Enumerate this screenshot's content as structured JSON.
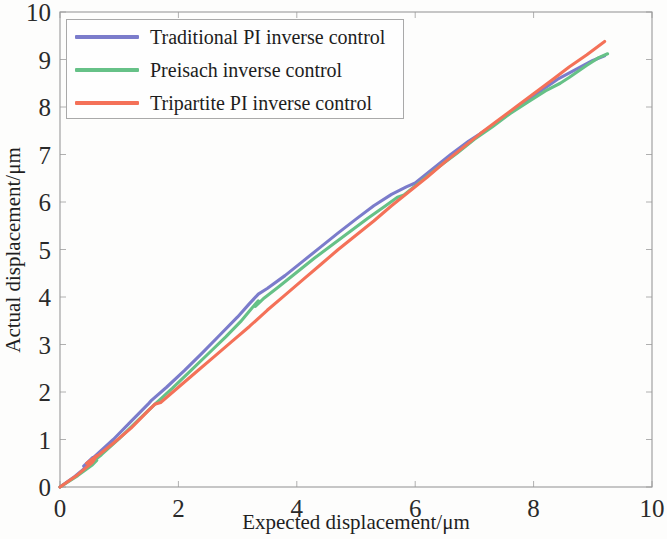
{
  "chart_data": {
    "type": "line",
    "title": "",
    "xlabel": "Expected displacement/μm",
    "ylabel": "Actual displacement/μm",
    "xlim": [
      0,
      10
    ],
    "ylim": [
      0,
      10
    ],
    "xticks": [
      0,
      2,
      4,
      6,
      8,
      10
    ],
    "yticks": [
      0,
      1,
      2,
      3,
      4,
      5,
      6,
      7,
      8,
      9,
      10
    ],
    "xtick_labels": [
      "0",
      "2",
      "4",
      "6",
      "8",
      "10"
    ],
    "ytick_labels": [
      "0",
      "1",
      "2",
      "3",
      "4",
      "5",
      "6",
      "7",
      "8",
      "9",
      "10"
    ],
    "grid": false,
    "legend_position": "upper left",
    "series": [
      {
        "name": "Traditional PI inverse control",
        "color": "#7b7ccb",
        "points": [
          [
            0.0,
            0.0
          ],
          [
            0.25,
            0.22
          ],
          [
            0.5,
            0.48
          ],
          [
            0.55,
            0.62
          ],
          [
            0.4,
            0.44
          ],
          [
            0.6,
            0.66
          ],
          [
            0.9,
            1.0
          ],
          [
            1.2,
            1.38
          ],
          [
            1.5,
            1.76
          ],
          [
            1.55,
            1.83
          ],
          [
            1.8,
            2.1
          ],
          [
            2.1,
            2.45
          ],
          [
            2.4,
            2.82
          ],
          [
            2.7,
            3.2
          ],
          [
            3.0,
            3.58
          ],
          [
            3.2,
            3.86
          ],
          [
            3.35,
            4.06
          ],
          [
            3.5,
            4.18
          ],
          [
            3.8,
            4.45
          ],
          [
            4.1,
            4.75
          ],
          [
            4.4,
            5.05
          ],
          [
            4.7,
            5.35
          ],
          [
            5.0,
            5.64
          ],
          [
            5.3,
            5.92
          ],
          [
            5.6,
            6.16
          ],
          [
            5.85,
            6.32
          ],
          [
            6.0,
            6.4
          ],
          [
            6.3,
            6.7
          ],
          [
            6.6,
            7.0
          ],
          [
            6.9,
            7.28
          ],
          [
            7.2,
            7.52
          ],
          [
            7.5,
            7.78
          ],
          [
            7.8,
            8.06
          ],
          [
            8.1,
            8.32
          ],
          [
            8.4,
            8.58
          ],
          [
            8.7,
            8.78
          ],
          [
            9.0,
            8.98
          ],
          [
            9.2,
            9.08
          ]
        ]
      },
      {
        "name": "Preisach inverse control",
        "color": "#66c187",
        "points": [
          [
            0.0,
            0.0
          ],
          [
            0.3,
            0.24
          ],
          [
            0.55,
            0.47
          ],
          [
            0.62,
            0.56
          ],
          [
            0.5,
            0.48
          ],
          [
            0.7,
            0.68
          ],
          [
            1.0,
            1.02
          ],
          [
            1.3,
            1.38
          ],
          [
            1.6,
            1.74
          ],
          [
            1.9,
            2.08
          ],
          [
            2.2,
            2.44
          ],
          [
            2.5,
            2.8
          ],
          [
            2.8,
            3.16
          ],
          [
            3.05,
            3.48
          ],
          [
            3.25,
            3.78
          ],
          [
            3.35,
            3.92
          ],
          [
            3.3,
            3.8
          ],
          [
            3.45,
            3.98
          ],
          [
            3.7,
            4.22
          ],
          [
            4.0,
            4.52
          ],
          [
            4.3,
            4.82
          ],
          [
            4.6,
            5.1
          ],
          [
            4.9,
            5.38
          ],
          [
            5.2,
            5.66
          ],
          [
            5.5,
            5.92
          ],
          [
            5.7,
            6.1
          ],
          [
            5.8,
            6.14
          ],
          [
            6.1,
            6.44
          ],
          [
            6.4,
            6.74
          ],
          [
            6.7,
            7.02
          ],
          [
            7.0,
            7.32
          ],
          [
            7.3,
            7.58
          ],
          [
            7.6,
            7.86
          ],
          [
            7.9,
            8.1
          ],
          [
            8.2,
            8.34
          ],
          [
            8.45,
            8.5
          ],
          [
            8.6,
            8.62
          ],
          [
            8.9,
            8.88
          ],
          [
            9.1,
            9.04
          ],
          [
            9.25,
            9.12
          ]
        ]
      },
      {
        "name": "Tripartite PI inverse control",
        "color": "#f47158",
        "points": [
          [
            0.0,
            0.0
          ],
          [
            0.3,
            0.26
          ],
          [
            0.55,
            0.52
          ],
          [
            0.62,
            0.66
          ],
          [
            0.45,
            0.5
          ],
          [
            0.6,
            0.62
          ],
          [
            0.9,
            0.92
          ],
          [
            1.2,
            1.24
          ],
          [
            1.5,
            1.62
          ],
          [
            1.6,
            1.74
          ],
          [
            1.7,
            1.78
          ],
          [
            2.0,
            2.1
          ],
          [
            2.3,
            2.42
          ],
          [
            2.6,
            2.74
          ],
          [
            2.9,
            3.06
          ],
          [
            3.2,
            3.38
          ],
          [
            3.5,
            3.72
          ],
          [
            3.8,
            4.04
          ],
          [
            4.1,
            4.36
          ],
          [
            4.4,
            4.68
          ],
          [
            4.7,
            5.0
          ],
          [
            5.0,
            5.3
          ],
          [
            5.3,
            5.6
          ],
          [
            5.6,
            5.92
          ],
          [
            5.9,
            6.22
          ],
          [
            6.2,
            6.52
          ],
          [
            6.5,
            6.84
          ],
          [
            6.8,
            7.14
          ],
          [
            7.1,
            7.44
          ],
          [
            7.4,
            7.72
          ],
          [
            7.7,
            8.0
          ],
          [
            8.0,
            8.28
          ],
          [
            8.3,
            8.56
          ],
          [
            8.6,
            8.84
          ],
          [
            8.9,
            9.1
          ],
          [
            9.2,
            9.38
          ]
        ]
      }
    ]
  },
  "legend": {
    "entries": [
      {
        "label": "Traditional PI inverse control",
        "color": "#7b7ccb"
      },
      {
        "label": "Preisach inverse control",
        "color": "#66c187"
      },
      {
        "label": "Tripartite PI inverse control",
        "color": "#f47158"
      }
    ]
  }
}
